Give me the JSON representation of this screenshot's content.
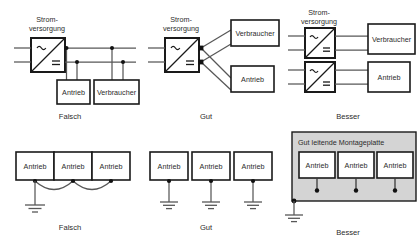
{
  "figure": {
    "colors": {
      "background": "#ffffff",
      "wire": "#575757",
      "outline": "#1a1a1a",
      "plate": "#d4d4d4",
      "node": "#111111",
      "text": "#2b2b2b"
    }
  },
  "labels": {
    "supply_line1": "Strom-",
    "supply_line2": "versorgung",
    "drive": "Antrieb",
    "load": "Verbraucher",
    "plate": "Gut leitende Montageplatte"
  },
  "captions": {
    "wrong": "Falsch",
    "good": "Gut",
    "better": "Besser"
  },
  "symbols": {
    "ac": "~",
    "dc": "="
  },
  "panels": [
    {
      "id": "top-wrong",
      "caption": "Falsch",
      "row": "top",
      "column": 1,
      "topology": "daisy-chain-bus",
      "supplies": 1,
      "blocks": [
        "Antrieb",
        "Verbraucher"
      ]
    },
    {
      "id": "top-good",
      "caption": "Gut",
      "row": "top",
      "column": 2,
      "topology": "star-from-single-supply",
      "supplies": 1,
      "blocks": [
        "Verbraucher",
        "Antrieb"
      ]
    },
    {
      "id": "top-better",
      "caption": "Besser",
      "row": "top",
      "column": 3,
      "topology": "separate-supply-per-load",
      "supplies": 2,
      "blocks": [
        "Verbraucher",
        "Antrieb"
      ]
    },
    {
      "id": "bottom-wrong",
      "caption": "Falsch",
      "row": "bottom",
      "column": 1,
      "topology": "series-ground-chain-single-point",
      "blocks": [
        "Antrieb",
        "Antrieb",
        "Antrieb"
      ]
    },
    {
      "id": "bottom-good",
      "caption": "Gut",
      "row": "bottom",
      "column": 2,
      "topology": "individual-ground-per-drive",
      "blocks": [
        "Antrieb",
        "Antrieb",
        "Antrieb"
      ]
    },
    {
      "id": "bottom-better",
      "caption": "Besser",
      "row": "bottom",
      "column": 3,
      "topology": "conductive-mounting-plate",
      "plate_label": "Gut leitende Montageplatte",
      "blocks": [
        "Antrieb",
        "Antrieb",
        "Antrieb"
      ]
    }
  ]
}
